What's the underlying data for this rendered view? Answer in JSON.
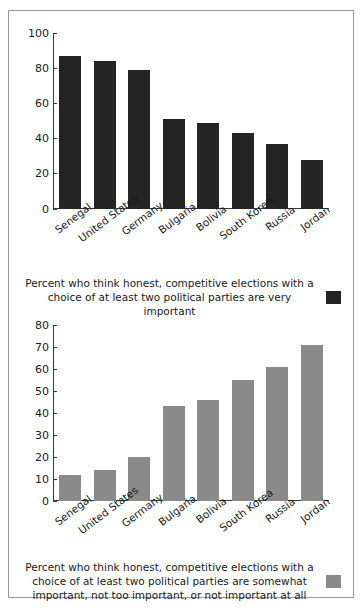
{
  "figure": {
    "colors": {
      "dark_bar": "#242424",
      "gray_bar": "#8a8a8a",
      "frame": "#9a9a9a",
      "axis": "#3a3a3a",
      "background": "#ffffff"
    }
  },
  "chart_data": [
    {
      "type": "bar",
      "id": "very-important",
      "title": "",
      "caption": "Percent who think honest, competitive elections with a choice of at least two political parties are very important",
      "legend_swatch_color": "#242424",
      "legend_position": "caption-right",
      "grid": false,
      "xlabel": "",
      "ylabel": "",
      "ylim": [
        0,
        100
      ],
      "yticks": [
        0,
        20,
        40,
        60,
        80,
        100
      ],
      "ytick_labels": [
        "0",
        "20",
        "40",
        "60",
        "80",
        "100"
      ],
      "categories": [
        "Senegal",
        "United States",
        "Germany",
        "Bulgaria",
        "Bolivia",
        "South Korea",
        "Russia",
        "Jordan"
      ],
      "values": [
        87,
        84,
        79,
        51,
        49,
        43,
        37,
        28
      ]
    },
    {
      "type": "bar",
      "id": "somewhat-or-less-important",
      "title": "",
      "caption": "Percent who think honest, competitive elections with a choice of at least two political parties are somewhat important, not too important, or not important at all",
      "legend_swatch_color": "#8a8a8a",
      "legend_position": "caption-right",
      "grid": false,
      "xlabel": "",
      "ylabel": "",
      "ylim": [
        0,
        80
      ],
      "yticks": [
        0,
        10,
        20,
        30,
        40,
        50,
        60,
        70,
        80
      ],
      "ytick_labels": [
        "0",
        "10",
        "20",
        "30",
        "40",
        "50",
        "60",
        "70",
        "80"
      ],
      "categories": [
        "Senegal",
        "United States",
        "Germany",
        "Bulgaria",
        "Bolivia",
        "South Korea",
        "Russia",
        "Jordan"
      ],
      "values": [
        12,
        14,
        20,
        43,
        46,
        55,
        61,
        71
      ]
    }
  ]
}
